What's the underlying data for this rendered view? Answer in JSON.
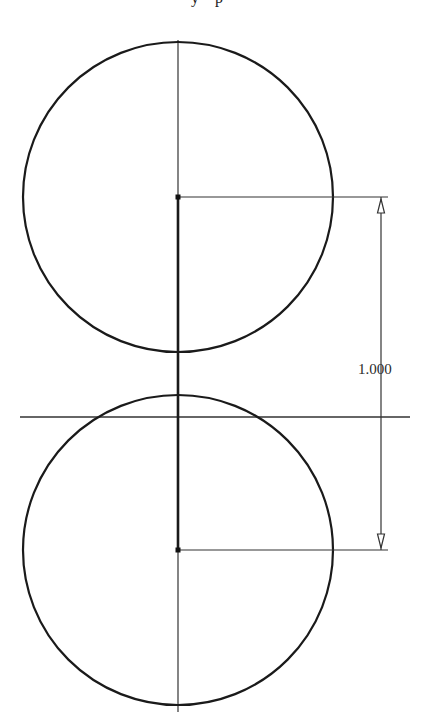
{
  "header": {
    "cropped_text_fragment": "y p"
  },
  "drawing": {
    "type": "sketch-two-circles-with-dimension",
    "colors": {
      "background": "#ffffff",
      "stroke": "#1a1a1a",
      "thin_stroke": "#333333"
    },
    "vertical_centerline": {
      "x": 178,
      "y1": 40,
      "y2": 712
    },
    "horizontal_axis": {
      "y": 417,
      "x1": 20,
      "x2": 410
    },
    "construction_segment": {
      "x": 178,
      "y1": 197,
      "y2": 550
    },
    "circles": [
      {
        "name": "top-circle",
        "cx": 178,
        "cy": 197,
        "r": 155
      },
      {
        "name": "bottom-circle",
        "cx": 178,
        "cy": 550,
        "r": 155
      }
    ],
    "center_points": [
      {
        "name": "top-center-point",
        "x": 178,
        "y": 197
      },
      {
        "name": "bottom-center-point",
        "x": 178,
        "y": 550
      }
    ],
    "dimension": {
      "value": "1.000",
      "extension_lines": [
        {
          "y": 197,
          "x1": 178,
          "x2": 388
        },
        {
          "y": 550,
          "x1": 178,
          "x2": 388
        }
      ],
      "dimension_line_x": 381,
      "text_x": 358,
      "text_y": 374
    }
  }
}
